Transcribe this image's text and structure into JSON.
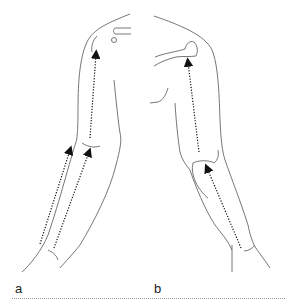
{
  "figure": {
    "panels": [
      {
        "id": "a",
        "label": "a",
        "description": "Anterior view of arm with three dotted arrows pointing upward (two on forearm, one on upper arm)"
      },
      {
        "id": "b",
        "label": "b",
        "description": "Posterior view of arm with two dotted arrows pointing upward (forearm to elbow, upper arm to shoulder)"
      }
    ],
    "caption": ""
  },
  "colors": {
    "line": "#555555",
    "arrow": "#111111",
    "background": "#ffffff"
  }
}
